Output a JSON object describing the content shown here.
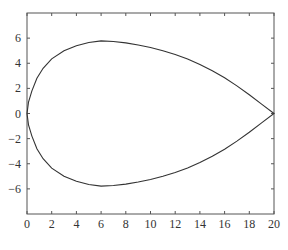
{
  "chart_data": {
    "type": "line",
    "title": "",
    "xlabel": "",
    "ylabel": "",
    "xlim": [
      0,
      20
    ],
    "ylim": [
      -8,
      8
    ],
    "grid": false,
    "legend": null,
    "x_ticks": [
      0,
      2,
      4,
      6,
      8,
      10,
      12,
      14,
      16,
      18,
      20
    ],
    "y_ticks": [
      6,
      4,
      2,
      0,
      -2,
      -4,
      -6
    ],
    "y_tick_labels": [
      "6",
      "4",
      "2",
      "0",
      "−2",
      "−4",
      "−6"
    ],
    "series": [
      {
        "name": "closed teardrop curve",
        "color": "#333333",
        "points": [
          [
            20,
            0
          ],
          [
            19,
            0.75
          ],
          [
            18,
            1.5
          ],
          [
            17,
            2.2
          ],
          [
            16,
            2.85
          ],
          [
            15,
            3.4
          ],
          [
            14,
            3.9
          ],
          [
            13,
            4.35
          ],
          [
            12,
            4.7
          ],
          [
            11,
            5.0
          ],
          [
            10,
            5.25
          ],
          [
            9,
            5.45
          ],
          [
            8,
            5.62
          ],
          [
            7,
            5.73
          ],
          [
            6,
            5.78
          ],
          [
            5,
            5.65
          ],
          [
            4,
            5.4
          ],
          [
            3,
            5.0
          ],
          [
            2,
            4.35
          ],
          [
            1.3,
            3.6
          ],
          [
            0.8,
            2.8
          ],
          [
            0.4,
            1.8
          ],
          [
            0.12,
            0.9
          ],
          [
            0,
            0
          ],
          [
            0.12,
            -0.9
          ],
          [
            0.4,
            -1.8
          ],
          [
            0.8,
            -2.8
          ],
          [
            1.3,
            -3.6
          ],
          [
            2,
            -4.35
          ],
          [
            3,
            -5.0
          ],
          [
            4,
            -5.4
          ],
          [
            5,
            -5.65
          ],
          [
            6,
            -5.78
          ],
          [
            7,
            -5.73
          ],
          [
            8,
            -5.62
          ],
          [
            9,
            -5.45
          ],
          [
            10,
            -5.25
          ],
          [
            11,
            -5.0
          ],
          [
            12,
            -4.7
          ],
          [
            13,
            -4.35
          ],
          [
            14,
            -3.9
          ],
          [
            15,
            -3.4
          ],
          [
            16,
            -2.85
          ],
          [
            17,
            -2.2
          ],
          [
            18,
            -1.5
          ],
          [
            19,
            -0.75
          ],
          [
            20,
            0
          ]
        ]
      }
    ]
  }
}
